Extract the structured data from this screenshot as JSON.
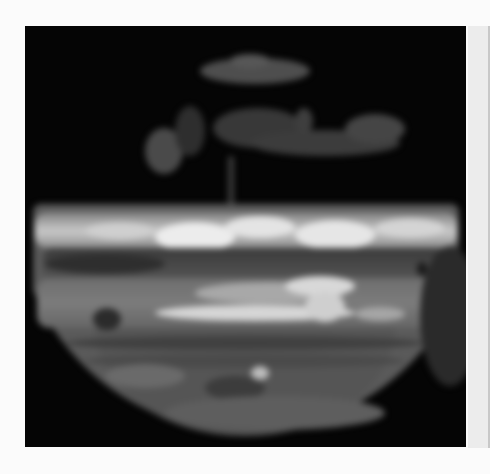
{
  "image": {
    "subject": "Jupiter",
    "description": "Grayscale banded planetary disk on black background",
    "colors": {
      "page_background": "#fbfbfb",
      "frame_background": "#050505",
      "bright_band": "#e6e6e6",
      "mid_band": "#7c7c7c",
      "dark_belt": "#3a3a3a",
      "side_strip": "#ececec"
    }
  }
}
